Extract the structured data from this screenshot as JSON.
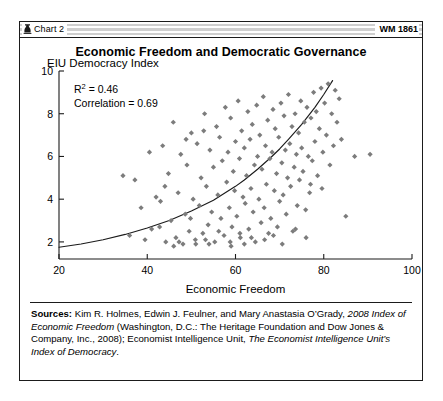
{
  "header": {
    "chart_tag": "Chart 2",
    "chart_tag_icon": "heritage-foundation-mark-icon",
    "wm_number": "WM 1861"
  },
  "title": "Economic Freedom and Democratic Governance",
  "annotations": {
    "r_squared_prefix": "R",
    "r_squared_exponent": "2",
    "r_squared_value": "= 0.46",
    "correlation": "Correlation = 0.69"
  },
  "sources": {
    "lead": "Sources:",
    "seg1": " Kim R. Holmes, Edwin J. Feulner, and Mary Anastasia O’Grady, ",
    "seg2_italic": "2008 Index of Economic Freedom",
    "seg3": " (Washington, D.C.: The Heritage Foundation and Dow Jones & Company, Inc., 2008); Economist Intelligence Unit, ",
    "seg4_italic": "The Economist Intelligence Unit’s Index of Democracy",
    "seg5": "."
  },
  "colors": {
    "marker": "#7c7c7c",
    "axis": "#1b1b1b",
    "trendline": "#1b1b1b",
    "frame": "#1b1b1b",
    "background": "#ffffff"
  },
  "chart_data": {
    "type": "scatter",
    "title": "Economic Freedom and Democratic Governance",
    "xlabel": "Economic Freedom",
    "ylabel": "EIU Democracy Index",
    "xlim": [
      20,
      100
    ],
    "ylim": [
      1.2,
      10
    ],
    "xticks": [
      20,
      40,
      60,
      80,
      100
    ],
    "yticks": [
      2,
      4,
      6,
      8,
      10
    ],
    "grid": false,
    "legend": null,
    "marker_shape": "diamond",
    "marker_color": "#7c7c7c",
    "annotations": [
      "R2 = 0.46",
      "Correlation = 0.69"
    ],
    "statistics": {
      "r_squared": 0.46,
      "correlation": 0.69
    },
    "trendline": {
      "type": "exponential",
      "note": "upward curving fit rising left to right",
      "points": [
        [
          20,
          1.75
        ],
        [
          25,
          1.9
        ],
        [
          30,
          2.1
        ],
        [
          35,
          2.35
        ],
        [
          40,
          2.65
        ],
        [
          45,
          3.0
        ],
        [
          50,
          3.45
        ],
        [
          55,
          3.95
        ],
        [
          60,
          4.6
        ],
        [
          62,
          4.9
        ],
        [
          65,
          5.4
        ],
        [
          68,
          5.95
        ],
        [
          70,
          6.35
        ],
        [
          72,
          6.8
        ],
        [
          75,
          7.5
        ],
        [
          78,
          8.3
        ],
        [
          80,
          8.9
        ],
        [
          82,
          9.55
        ]
      ]
    },
    "points": [
      [
        38.6,
        3.6
      ],
      [
        41.0,
        2.6
      ],
      [
        43.5,
        6.5
      ],
      [
        44.2,
        2.0
      ],
      [
        44.8,
        5.2
      ],
      [
        45.4,
        3.0
      ],
      [
        45.9,
        7.6
      ],
      [
        46.5,
        2.2
      ],
      [
        47.0,
        4.3
      ],
      [
        47.6,
        6.1
      ],
      [
        48.1,
        1.9
      ],
      [
        48.6,
        3.3
      ],
      [
        49.0,
        5.6
      ],
      [
        49.5,
        2.5
      ],
      [
        50.0,
        7.1
      ],
      [
        50.4,
        4.0
      ],
      [
        50.9,
        2.1
      ],
      [
        51.3,
        6.6
      ],
      [
        51.8,
        3.7
      ],
      [
        52.2,
        5.0
      ],
      [
        52.6,
        2.4
      ],
      [
        53.0,
        8.0
      ],
      [
        53.4,
        4.6
      ],
      [
        53.8,
        2.8
      ],
      [
        54.2,
        6.3
      ],
      [
        54.6,
        3.4
      ],
      [
        55.0,
        5.5
      ],
      [
        55.3,
        2.0
      ],
      [
        55.7,
        7.4
      ],
      [
        56.0,
        4.2
      ],
      [
        56.4,
        6.9
      ],
      [
        56.7,
        3.1
      ],
      [
        57.0,
        5.8
      ],
      [
        57.4,
        2.3
      ],
      [
        57.7,
        8.3
      ],
      [
        58.0,
        4.8
      ],
      [
        58.3,
        6.2
      ],
      [
        58.6,
        3.6
      ],
      [
        58.9,
        7.8
      ],
      [
        59.2,
        2.7
      ],
      [
        59.5,
        5.3
      ],
      [
        59.8,
        4.4
      ],
      [
        60.0,
        6.7
      ],
      [
        60.3,
        3.2
      ],
      [
        60.6,
        8.6
      ],
      [
        60.9,
        5.9
      ],
      [
        61.1,
        2.2
      ],
      [
        61.4,
        7.2
      ],
      [
        61.7,
        4.1
      ],
      [
        62.0,
        6.4
      ],
      [
        62.2,
        3.8
      ],
      [
        62.5,
        5.1
      ],
      [
        62.8,
        8.1
      ],
      [
        63.0,
        2.6
      ],
      [
        63.3,
        6.8
      ],
      [
        63.5,
        4.5
      ],
      [
        63.8,
        7.5
      ],
      [
        64.0,
        3.4
      ],
      [
        64.3,
        5.6
      ],
      [
        64.5,
        2.0
      ],
      [
        64.8,
        8.4
      ],
      [
        65.0,
        6.0
      ],
      [
        65.3,
        4.0
      ],
      [
        65.5,
        7.0
      ],
      [
        65.8,
        2.9
      ],
      [
        66.0,
        5.4
      ],
      [
        66.3,
        8.8
      ],
      [
        66.5,
        3.6
      ],
      [
        66.8,
        6.5
      ],
      [
        67.0,
        4.7
      ],
      [
        67.3,
        7.7
      ],
      [
        67.5,
        2.4
      ],
      [
        67.8,
        5.9
      ],
      [
        68.0,
        3.1
      ],
      [
        68.3,
        6.2
      ],
      [
        68.5,
        8.2
      ],
      [
        68.8,
        4.4
      ],
      [
        69.0,
        7.3
      ],
      [
        69.3,
        5.2
      ],
      [
        69.5,
        2.7
      ],
      [
        69.8,
        6.9
      ],
      [
        70.0,
        3.9
      ],
      [
        70.3,
        8.5
      ],
      [
        70.5,
        5.7
      ],
      [
        70.8,
        4.2
      ],
      [
        71.0,
        7.9
      ],
      [
        71.3,
        6.3
      ],
      [
        71.5,
        3.3
      ],
      [
        71.8,
        5.0
      ],
      [
        72.0,
        8.9
      ],
      [
        72.3,
        6.6
      ],
      [
        72.5,
        4.6
      ],
      [
        72.8,
        7.4
      ],
      [
        73.0,
        2.5
      ],
      [
        73.3,
        5.5
      ],
      [
        73.5,
        8.0
      ],
      [
        73.8,
        6.1
      ],
      [
        74.0,
        3.7
      ],
      [
        74.3,
        7.1
      ],
      [
        74.5,
        4.9
      ],
      [
        74.8,
        8.6
      ],
      [
        75.0,
        6.4
      ],
      [
        75.3,
        5.3
      ],
      [
        75.6,
        7.6
      ],
      [
        75.9,
        3.5
      ],
      [
        76.2,
        8.3
      ],
      [
        76.5,
        6.0
      ],
      [
        76.8,
        4.3
      ],
      [
        77.1,
        7.8
      ],
      [
        77.4,
        5.8
      ],
      [
        77.7,
        9.0
      ],
      [
        78.0,
        6.7
      ],
      [
        78.3,
        8.1
      ],
      [
        78.6,
        5.1
      ],
      [
        79.0,
        7.3
      ],
      [
        79.4,
        9.2
      ],
      [
        79.8,
        6.2
      ],
      [
        80.2,
        8.5
      ],
      [
        80.6,
        7.0
      ],
      [
        81.0,
        9.4
      ],
      [
        81.4,
        5.6
      ],
      [
        81.8,
        8.0
      ],
      [
        82.2,
        6.5
      ],
      [
        82.6,
        9.1
      ],
      [
        83.0,
        7.6
      ],
      [
        83.5,
        8.7
      ],
      [
        84.0,
        6.8
      ],
      [
        36.0,
        2.3
      ],
      [
        37.2,
        4.9
      ],
      [
        39.5,
        2.1
      ],
      [
        42.0,
        4.1
      ],
      [
        42.8,
        2.7
      ],
      [
        43.0,
        3.9
      ],
      [
        46.0,
        1.8
      ],
      [
        47.2,
        2.0
      ],
      [
        49.8,
        3.1
      ],
      [
        51.0,
        1.9
      ],
      [
        53.2,
        2.1
      ],
      [
        54.0,
        1.9
      ],
      [
        56.2,
        2.5
      ],
      [
        58.8,
        2.0
      ],
      [
        59.0,
        1.8
      ],
      [
        61.0,
        2.4
      ],
      [
        62.0,
        1.9
      ],
      [
        63.6,
        2.2
      ],
      [
        66.6,
        2.1
      ],
      [
        68.6,
        2.3
      ],
      [
        70.6,
        1.9
      ],
      [
        73.6,
        2.6
      ],
      [
        76.0,
        2.2
      ],
      [
        77.0,
        4.7
      ],
      [
        79.6,
        4.5
      ],
      [
        87.0,
        6.0
      ],
      [
        90.5,
        6.1
      ],
      [
        85.0,
        3.2
      ],
      [
        34.5,
        5.1
      ],
      [
        40.5,
        6.2
      ],
      [
        44.0,
        4.6
      ],
      [
        48.8,
        6.8
      ],
      [
        52.8,
        7.2
      ]
    ]
  }
}
